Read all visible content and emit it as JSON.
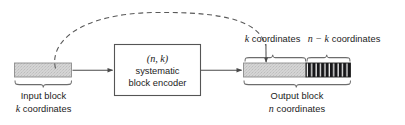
{
  "figure": {
    "title_visible": false,
    "background_color": "#ffffff",
    "line_color": "#4a4a4a",
    "text_color": "#1b1b1b",
    "block_fill_light": "#d2d2d2",
    "block_fill_dark": "#17171a",
    "hatch_stripe_color": "#ffffff"
  },
  "input_block": {
    "label_line1": "Input block",
    "label_line2_math": "k",
    "label_line2_rest": " coordinates",
    "fill_style": "light-gray-stipple"
  },
  "encoder": {
    "line1_math": "(n, k)",
    "line2": "systematic",
    "line3": "block encoder"
  },
  "output_block": {
    "label_line1": "Output block",
    "label_line2_math": "n",
    "label_line2_rest": " coordinates",
    "segment_left_fill": "light-gray-stipple",
    "segment_right_fill": "dark-vertical-hatch"
  },
  "top_labels": {
    "left_math": "k",
    "left_rest": " coordinates",
    "right_math": "n − k",
    "right_rest": " coordinates"
  },
  "connectors": {
    "solid_arrow_1": "input-block-to-encoder",
    "solid_arrow_2": "encoder-to-output-block",
    "dashed_arc": "input-block-copied-to-output-systematic-part",
    "downward_arrow": "points-into-output-left-segment"
  }
}
